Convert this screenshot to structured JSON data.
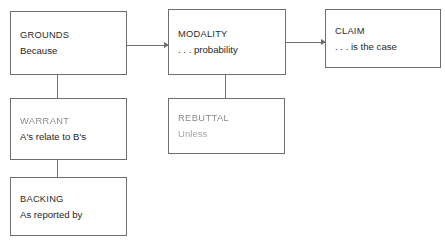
{
  "diagram": {
    "background_color": "#ffffff",
    "line_color": "#6e6e6e",
    "text_color": "#1f1f1f",
    "nodes": [
      {
        "id": "grounds",
        "label": "GROUNDS",
        "detail": "Because",
        "degraded": false
      },
      {
        "id": "modality",
        "label": "MODALITY",
        "detail": ". . . probability",
        "degraded": false
      },
      {
        "id": "claim",
        "label": "CLAIM",
        "detail": ". . . is the case",
        "degraded": false
      },
      {
        "id": "warrant",
        "label": "WARRANT",
        "detail": "A's relate to B's",
        "degraded": true
      },
      {
        "id": "rebuttal",
        "label": "REBUTTAL",
        "detail": "Unless",
        "degraded": true
      },
      {
        "id": "backing",
        "label": "BACKING",
        "detail": "As reported by",
        "degraded": false
      }
    ],
    "connectors": [
      {
        "id": "grounds-modality",
        "from": "grounds",
        "to": "modality",
        "kind": "arrow",
        "direction": "right"
      },
      {
        "id": "modality-claim",
        "from": "modality",
        "to": "claim",
        "kind": "arrow",
        "direction": "right"
      },
      {
        "id": "grounds-warrant",
        "from": "grounds",
        "to": "warrant",
        "kind": "line",
        "direction": "down"
      },
      {
        "id": "warrant-backing",
        "from": "warrant",
        "to": "backing",
        "kind": "line",
        "direction": "down"
      },
      {
        "id": "modality-rebuttal",
        "from": "modality",
        "to": "rebuttal",
        "kind": "line",
        "direction": "down"
      }
    ]
  }
}
